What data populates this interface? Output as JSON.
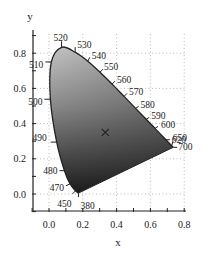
{
  "chart_data": {
    "type": "scatter",
    "title": "",
    "subtitle": "CIE 1931 chromaticity diagram (spectral locus, grayscale fill)",
    "xlabel": "x",
    "ylabel": "y",
    "xlim": [
      -0.1,
      0.8
    ],
    "ylim": [
      -0.1,
      0.9
    ],
    "x_ticks": [
      0.0,
      0.2,
      0.4,
      0.6,
      0.8
    ],
    "x_tick_labels": [
      "0.0",
      "0.2",
      "0.4",
      "0.6",
      "0.8"
    ],
    "y_ticks": [
      0.0,
      0.2,
      0.4,
      0.6,
      0.8
    ],
    "y_tick_labels": [
      "0.0",
      "0.2",
      "0.4",
      "0.6",
      "0.8"
    ],
    "grid": true,
    "grid_style": "dotted",
    "legend": "none",
    "series": [
      {
        "name": "spectral locus",
        "wavelength_labels_nm": [
          380,
          450,
          470,
          480,
          490,
          500,
          510,
          520,
          530,
          540,
          550,
          560,
          570,
          580,
          590,
          600,
          620,
          650,
          700
        ],
        "x": [
          0.1741,
          0.1566,
          0.1241,
          0.0913,
          0.0454,
          0.0082,
          0.0139,
          0.0743,
          0.1547,
          0.2296,
          0.3016,
          0.3731,
          0.4441,
          0.5125,
          0.5752,
          0.627,
          0.6915,
          0.726,
          0.7347
        ],
        "y": [
          0.005,
          0.0177,
          0.0578,
          0.1327,
          0.295,
          0.5384,
          0.7502,
          0.8338,
          0.8059,
          0.7543,
          0.6923,
          0.6245,
          0.5547,
          0.4866,
          0.4242,
          0.3725,
          0.3083,
          0.274,
          0.2653
        ]
      },
      {
        "name": "white point",
        "marker": "x",
        "x": [
          0.333
        ],
        "y": [
          0.333
        ]
      }
    ],
    "annotations": [
      "380",
      "450",
      "470",
      "480",
      "490",
      "500",
      "510",
      "520",
      "530",
      "540",
      "550",
      "560",
      "570",
      "580",
      "590",
      "600",
      "620",
      "650",
      "700"
    ]
  },
  "axes": {
    "x_title": "x",
    "y_title": "y"
  }
}
